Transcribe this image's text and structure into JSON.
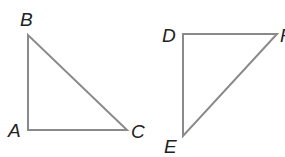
{
  "diagram": {
    "triangles": [
      {
        "name": "ABC",
        "vertices": {
          "A": [
            28,
            130
          ],
          "B": [
            28,
            35
          ],
          "C": [
            127,
            130
          ]
        },
        "labels": [
          {
            "text": "A",
            "x": 8,
            "y": 137
          },
          {
            "text": "B",
            "x": 20,
            "y": 26
          },
          {
            "text": "C",
            "x": 131,
            "y": 138
          }
        ]
      },
      {
        "name": "DEF",
        "vertices": {
          "D": [
            183,
            34
          ],
          "F": [
            277,
            34
          ],
          "E": [
            183,
            136
          ]
        },
        "labels": [
          {
            "text": "D",
            "x": 162,
            "y": 42
          },
          {
            "text": "E",
            "x": 164,
            "y": 153
          },
          {
            "text": "F",
            "x": 280,
            "y": 42
          }
        ]
      }
    ],
    "stroke_color": "#8a8a8a"
  }
}
